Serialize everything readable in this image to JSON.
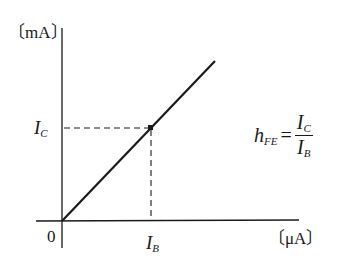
{
  "diagram": {
    "y_axis": {
      "unit_label": "〔mA〕"
    },
    "x_axis": {
      "unit_label": "〔μA〕"
    },
    "origin_label": "0",
    "point": {
      "y_label": {
        "main": "I",
        "sub": "C"
      },
      "x_label": {
        "main": "I",
        "sub": "B"
      }
    },
    "formula": {
      "lhs_main": "h",
      "lhs_sub": "FE",
      "equals": "=",
      "numerator_main": "I",
      "numerator_sub": "C",
      "denominator_main": "I",
      "denominator_sub": "B"
    },
    "colors": {
      "ink": "#1a1a1a",
      "background": "#ffffff"
    }
  }
}
